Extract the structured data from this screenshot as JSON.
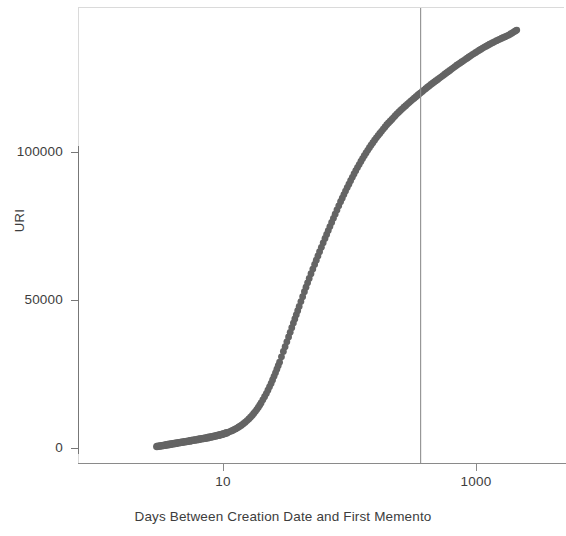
{
  "chart_data": {
    "type": "scatter",
    "title": "",
    "subtitle": "",
    "xlabel": "Days Between Creation Date and First Memento",
    "ylabel": "URI",
    "xscale": "log",
    "yscale": "linear",
    "xlim": [
      3,
      2200
    ],
    "ylim": [
      0,
      142000
    ],
    "grid": false,
    "legend": null,
    "xticks": [
      10,
      1000
    ],
    "xticklabels": [
      "10",
      "1000"
    ],
    "yticks": [
      0,
      50000,
      100000
    ],
    "yticklabels": [
      "0",
      "50000",
      "100000"
    ],
    "annotations": [
      {
        "type": "vertical-line",
        "x": 365,
        "label": "",
        "color": "#8f8f8f"
      }
    ],
    "marker_color": "#646464",
    "series": [
      {
        "name": "Cumulative URIs",
        "x": [
          3,
          4,
          5,
          6,
          7,
          8,
          9,
          10,
          11,
          12,
          13,
          14,
          15,
          16,
          17,
          18,
          19,
          20,
          22,
          24,
          26,
          28,
          30,
          33,
          36,
          40,
          44,
          48,
          53,
          58,
          64,
          70,
          77,
          85,
          93,
          102,
          112,
          123,
          135,
          148,
          163,
          179,
          197,
          216,
          237,
          261,
          287,
          315,
          346,
          365,
          400,
          440,
          483,
          531,
          583,
          641,
          704,
          774,
          851,
          935,
          1028,
          1130,
          1242,
          1365,
          1500,
          1650,
          1815,
          1996,
          2100
        ],
        "y": [
          500,
          1400,
          2100,
          2700,
          3200,
          3700,
          4200,
          4700,
          5300,
          6000,
          6800,
          7700,
          8700,
          9800,
          11000,
          12300,
          13700,
          15200,
          18400,
          21800,
          25400,
          29000,
          32600,
          37500,
          42200,
          47800,
          52800,
          57300,
          62000,
          66300,
          70800,
          74800,
          79000,
          83200,
          86800,
          90300,
          93700,
          96800,
          99700,
          102300,
          104800,
          107000,
          109200,
          111000,
          112900,
          114600,
          116200,
          117700,
          119200,
          120000,
          121400,
          122800,
          124100,
          125400,
          126700,
          128000,
          129300,
          130500,
          131700,
          132900,
          134000,
          135100,
          136100,
          137000,
          137900,
          138700,
          139500,
          140600,
          141200
        ]
      }
    ]
  },
  "axes": {
    "y_tick_labels": [
      "100000",
      "50000",
      "0"
    ],
    "x_tick_labels": [
      "10",
      "1000"
    ],
    "y_axis_title": "URI",
    "x_axis_title": "Days Between Creation Date and First Memento"
  }
}
